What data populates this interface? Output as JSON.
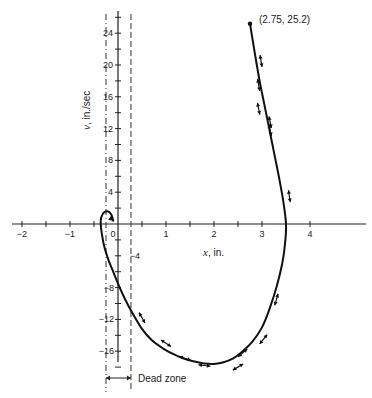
{
  "chart_data": {
    "type": "line",
    "title": "",
    "subtitle": "Phase-plane trajectory with dead zone",
    "xlabel": "x, in.",
    "ylabel": "v, in./sec",
    "xlabel_var": "x",
    "xlabel_unit": ", in.",
    "ylabel_var": "v",
    "ylabel_unit": ", in./sec",
    "xlim": [
      -2.2,
      5.1
    ],
    "ylim": [
      -19,
      26.5
    ],
    "grid": false,
    "legend": "none",
    "x_ticks": [
      -2,
      -1,
      0,
      1,
      2,
      3,
      4
    ],
    "x_tick_labels": [
      "−2",
      "−1",
      "0",
      "1",
      "2",
      "3",
      "4"
    ],
    "x_minor_ticks": [
      -1.5,
      -0.5,
      0.5,
      1.5,
      2.5,
      3.5
    ],
    "y_ticks": [
      24,
      20,
      16,
      12,
      8,
      4,
      -4,
      -8,
      -12,
      -16
    ],
    "y_tick_labels": [
      "24",
      "20",
      "16",
      "12",
      "8",
      "4",
      "−4",
      "−8",
      "−12",
      "−16"
    ],
    "y_minor_ticks": [
      26,
      22,
      18,
      14,
      10,
      6,
      2,
      -2,
      -6,
      -10,
      -14,
      -18
    ],
    "dead_zone": {
      "x_min": -0.25,
      "x_max": 0.27,
      "label": "Dead zone"
    },
    "start_point": {
      "x": 2.75,
      "y": 25.2,
      "label": "(2.75, 25.2)"
    },
    "series": [
      {
        "name": "trajectory",
        "x": [
          2.75,
          2.85,
          2.95,
          3.05,
          3.15,
          3.25,
          3.35,
          3.44,
          3.5,
          3.48,
          3.42,
          3.3,
          3.15,
          3.0,
          2.8,
          2.6,
          2.4,
          2.2,
          2.0,
          1.8,
          1.6,
          1.4,
          1.2,
          0.95,
          0.7,
          0.5,
          0.3,
          0.15,
          0.0,
          -0.1,
          -0.2,
          -0.28,
          -0.33,
          -0.36,
          -0.35,
          -0.3,
          -0.22,
          -0.14,
          -0.1
        ],
        "y": [
          25.2,
          21.5,
          18.0,
          15.0,
          12.0,
          9.0,
          6.0,
          3.0,
          0.0,
          -2.5,
          -5.0,
          -8.0,
          -10.8,
          -13.0,
          -14.8,
          -16.0,
          -16.9,
          -17.4,
          -17.6,
          -17.55,
          -17.3,
          -17.0,
          -16.5,
          -15.7,
          -14.6,
          -13.2,
          -11.2,
          -9.5,
          -7.5,
          -6.0,
          -4.5,
          -3.0,
          -1.5,
          0.0,
          0.8,
          1.4,
          1.6,
          1.2,
          0.4
        ]
      }
    ],
    "direction_markers": [
      {
        "x": 2.98,
        "y": 20.5
      },
      {
        "x": 2.93,
        "y": 17.5
      },
      {
        "x": 2.93,
        "y": 14.5
      },
      {
        "x": 3.17,
        "y": 12.8
      },
      {
        "x": 3.17,
        "y": 11.8
      },
      {
        "x": 3.57,
        "y": 3.5
      },
      {
        "x": 3.3,
        "y": -9.5
      },
      {
        "x": 3.03,
        "y": -14.5
      },
      {
        "x": 2.6,
        "y": -16.2
      },
      {
        "x": 2.5,
        "y": -18.0
      },
      {
        "x": 1.8,
        "y": -17.8
      },
      {
        "x": 1.4,
        "y": -16.9
      },
      {
        "x": 1.0,
        "y": -15.0
      },
      {
        "x": 0.5,
        "y": -11.8
      }
    ]
  }
}
